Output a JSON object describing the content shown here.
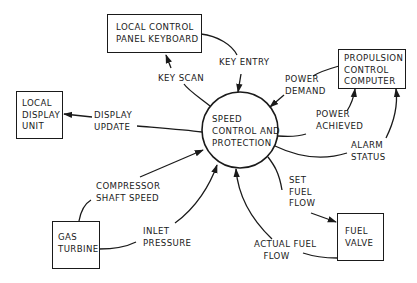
{
  "diagram": {
    "type": "context-data-flow-diagram",
    "center_process": {
      "id": "speed-control",
      "label_lines": [
        "SPEED",
        "CONTROL AND",
        "PROTECTION"
      ]
    },
    "entities": [
      {
        "id": "keyboard",
        "label_lines": [
          "LOCAL CONTROL",
          "PANEL KEYBOARD"
        ]
      },
      {
        "id": "display",
        "label_lines": [
          "LOCAL",
          "DISPLAY",
          "UNIT"
        ]
      },
      {
        "id": "pcc",
        "label_lines": [
          "PROPULSION",
          "CONTROL",
          "COMPUTER"
        ]
      },
      {
        "id": "gas-turbine",
        "label_lines": [
          "GAS",
          "TURBINE"
        ]
      },
      {
        "id": "fuel-valve",
        "label_lines": [
          "FUEL",
          "VALVE"
        ]
      }
    ],
    "flows": [
      {
        "id": "key-scan",
        "label_lines": [
          "KEY SCAN"
        ],
        "from": "speed-control",
        "to": "keyboard"
      },
      {
        "id": "key-entry",
        "label_lines": [
          "KEY ENTRY"
        ],
        "from": "keyboard",
        "to": "speed-control"
      },
      {
        "id": "display-update",
        "label_lines": [
          "DISPLAY",
          "UPDATE"
        ],
        "from": "speed-control",
        "to": "display"
      },
      {
        "id": "power-demand",
        "label_lines": [
          "POWER",
          "DEMAND"
        ],
        "from": "pcc",
        "to": "speed-control"
      },
      {
        "id": "power-achieved",
        "label_lines": [
          "POWER",
          "ACHIEVED"
        ],
        "from": "speed-control",
        "to": "pcc"
      },
      {
        "id": "alarm-status",
        "label_lines": [
          "ALARM",
          "STATUS"
        ],
        "from": "speed-control",
        "to": "pcc"
      },
      {
        "id": "set-fuel-flow",
        "label_lines": [
          "SET",
          "FUEL",
          "FLOW"
        ],
        "from": "speed-control",
        "to": "fuel-valve"
      },
      {
        "id": "actual-fuel-flow",
        "label_lines": [
          "ACTUAL FUEL",
          "FLOW"
        ],
        "from": "fuel-valve",
        "to": "speed-control"
      },
      {
        "id": "compressor-shaft-speed",
        "label_lines": [
          "COMPRESSOR",
          "SHAFT SPEED"
        ],
        "from": "gas-turbine",
        "to": "speed-control"
      },
      {
        "id": "inlet-pressure",
        "label_lines": [
          "INLET",
          "PRESSURE"
        ],
        "from": "gas-turbine",
        "to": "speed-control"
      }
    ]
  },
  "labels": {
    "center": "SPEED\nCONTROL AND\nPROTECTION",
    "keyboard": "LOCAL CONTROL\nPANEL KEYBOARD",
    "display": "LOCAL\nDISPLAY\nUNIT",
    "pcc": "PROPULSION\nCONTROL\nCOMPUTER",
    "gas_turbine": "GAS\nTURBINE",
    "fuel_valve": "FUEL\nVALVE",
    "key_scan": "KEY SCAN",
    "key_entry": "KEY ENTRY",
    "display_update": "DISPLAY\nUPDATE",
    "power_demand": "POWER\nDEMAND",
    "power_achieved": "POWER\nACHIEVED",
    "alarm_status": "ALARM\nSTATUS",
    "set_fuel_flow": "SET\nFUEL\nFLOW",
    "actual_fuel_flow": "ACTUAL FUEL\n   FLOW",
    "compressor_shaft_speed": "COMPRESSOR\nSHAFT SPEED",
    "inlet_pressure": "INLET\nPRESSURE"
  },
  "colors": {
    "ink": "#1a1a1a",
    "background": "#ffffff"
  }
}
